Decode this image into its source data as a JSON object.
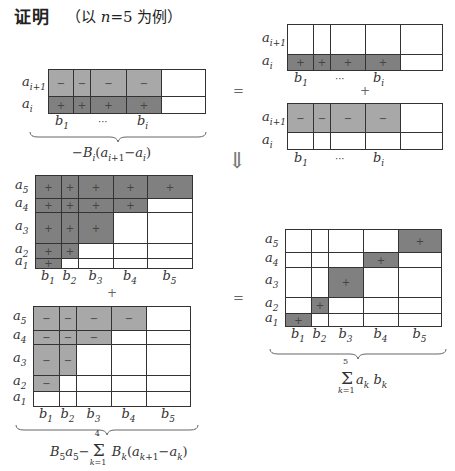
{
  "header": {
    "title": "证明",
    "subtitle_prefix": "（以 ",
    "subtitle_var": "n",
    "subtitle_eq": "=5",
    "subtitle_suffix": " 为例）"
  },
  "colors": {
    "light_shade": "#a8a8a8",
    "dark_shade": "#808080",
    "border": "#333333"
  },
  "symbols": {
    "equals": "=",
    "plus": "+",
    "implies_arrow": "⇓"
  },
  "panel_top_left": {
    "rows": [
      {
        "label": "a",
        "sub": "i+1",
        "cells": [
          "−",
          "−",
          "−",
          "−",
          ""
        ],
        "shade": [
          "light",
          "light",
          "light",
          "light",
          "none"
        ]
      },
      {
        "label": "a",
        "sub": "i",
        "cells": [
          "+",
          "+",
          "+",
          "+",
          ""
        ],
        "shade": [
          "dark",
          "dark",
          "dark",
          "dark",
          "none"
        ]
      }
    ],
    "col_labels": [
      {
        "t": "b",
        "s": "1"
      },
      {
        "t": "···",
        "s": ""
      },
      {
        "t": "b",
        "s": "i"
      }
    ],
    "formula": "−B_i(a_{i+1} − a_i)"
  },
  "panel_top_right_a": {
    "rows": [
      {
        "label": "a",
        "sub": "i+1",
        "cells": [
          "",
          "",
          "",
          "",
          ""
        ],
        "shade": [
          "none",
          "none",
          "none",
          "none",
          "none"
        ]
      },
      {
        "label": "a",
        "sub": "i",
        "cells": [
          "+",
          "+",
          "+",
          "+",
          ""
        ],
        "shade": [
          "dark",
          "dark",
          "dark",
          "dark",
          "none"
        ]
      }
    ],
    "col_labels": [
      {
        "t": "b",
        "s": "1"
      },
      {
        "t": "···",
        "s": ""
      },
      {
        "t": "b",
        "s": "i"
      }
    ]
  },
  "panel_top_right_b": {
    "rows": [
      {
        "label": "a",
        "sub": "i+1",
        "cells": [
          "−",
          "−",
          "−",
          "−",
          ""
        ],
        "shade": [
          "light",
          "light",
          "light",
          "light",
          "none"
        ]
      },
      {
        "label": "a",
        "sub": "i",
        "cells": [
          "",
          "",
          "",
          "",
          ""
        ],
        "shade": [
          "none",
          "none",
          "none",
          "none",
          "none"
        ]
      }
    ],
    "col_labels": [
      {
        "t": "b",
        "s": "1"
      },
      {
        "t": "···",
        "s": ""
      },
      {
        "t": "b",
        "s": "i"
      }
    ]
  },
  "panel_mid_left": {
    "row_labels": [
      "a5",
      "a4",
      "a3",
      "a2",
      "a1"
    ],
    "col_labels": [
      "b1",
      "b2",
      "b3",
      "b4",
      "b5"
    ],
    "cells": [
      [
        "+",
        "+",
        "+",
        "+",
        "+"
      ],
      [
        "+",
        "+",
        "+",
        "+",
        ""
      ],
      [
        "+",
        "+",
        "+",
        "",
        ""
      ],
      [
        "+",
        "+",
        "",
        "",
        ""
      ],
      [
        "+",
        "",
        "",
        "",
        ""
      ]
    ]
  },
  "panel_bottom_left": {
    "row_labels": [
      "a5",
      "a4",
      "a3",
      "a2",
      "a1"
    ],
    "col_labels": [
      "b1",
      "b2",
      "b3",
      "b4",
      "b5"
    ],
    "cells": [
      [
        "−",
        "−",
        "−",
        "−",
        ""
      ],
      [
        "−",
        "−",
        "−",
        "",
        ""
      ],
      [
        "−",
        "−",
        "",
        "",
        ""
      ],
      [
        "−",
        "",
        "",
        "",
        ""
      ],
      [
        "",
        "",
        "",
        "",
        ""
      ]
    ],
    "formula": "B5a5 − Σ_{k=1}^{4} B_k(a_{k+1} − a_k)"
  },
  "panel_right": {
    "row_labels": [
      "a5",
      "a4",
      "a3",
      "a2",
      "a1"
    ],
    "col_labels": [
      "b1",
      "b2",
      "b3",
      "b4",
      "b5"
    ],
    "cells": [
      [
        "",
        "",
        "",
        "",
        "+"
      ],
      [
        "",
        "",
        "",
        "+",
        ""
      ],
      [
        "",
        "",
        "+",
        "",
        ""
      ],
      [
        "",
        "+",
        "",
        "",
        ""
      ],
      [
        "+",
        "",
        "",
        "",
        ""
      ]
    ],
    "formula": "Σ_{k=1}^{5} a_k b_k"
  }
}
